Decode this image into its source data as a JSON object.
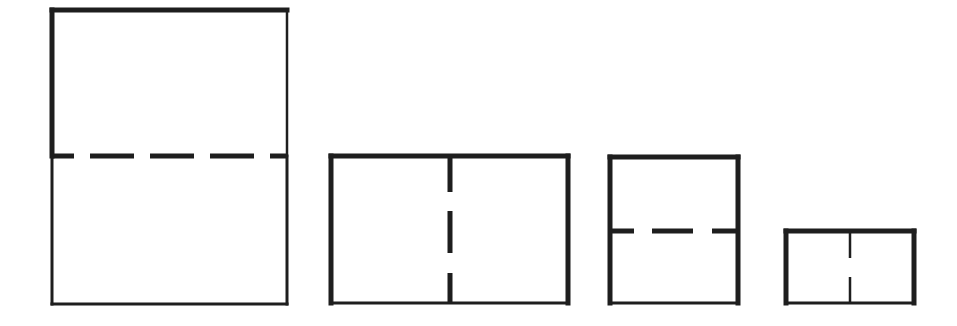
{
  "diagram": {
    "title": "Rectangle folding diagram",
    "stroke_color": "#1e1e1e",
    "background": "#ffffff",
    "shapes": [
      {
        "id": "shape-1",
        "label": "Tall rectangle folded horizontally",
        "x": 52,
        "y": 10,
        "w": 235,
        "h": 294,
        "edges": {
          "top": {
            "width": 5
          },
          "left_upper": {
            "width": 5
          },
          "right_upper": {
            "width": 2.5
          },
          "left_lower": {
            "width": 3
          },
          "right_lower": {
            "width": 3
          },
          "bottom": {
            "width": 3
          }
        },
        "fold": {
          "orientation": "horizontal",
          "pos": 156,
          "width": 5,
          "dash": "22 16 44 16 44 16 44 16 44 16 44",
          "offset": 0
        }
      },
      {
        "id": "shape-2",
        "label": "Wide rectangle folded vertically",
        "x": 331,
        "y": 156,
        "w": 237,
        "h": 147,
        "edges": {
          "top": {
            "width": 5
          },
          "left": {
            "width": 5
          },
          "right": {
            "width": 5
          },
          "bottom": {
            "width": 3
          }
        },
        "fold": {
          "orientation": "vertical",
          "pos": 450,
          "width": 5,
          "dash": "36 19 42 20 36",
          "offset": 0
        }
      },
      {
        "id": "shape-3",
        "label": "Square folded horizontally",
        "x": 610,
        "y": 157,
        "w": 128,
        "h": 146,
        "edges": {
          "top": {
            "width": 5
          },
          "left": {
            "width": 5
          },
          "right": {
            "width": 5
          },
          "bottom": {
            "width": 3
          }
        },
        "fold": {
          "orientation": "horizontal",
          "pos": 231,
          "width": 5,
          "dash": "24 18 41 19 30",
          "offset": 0
        }
      },
      {
        "id": "shape-4",
        "label": "Small rectangle folded vertically",
        "x": 786,
        "y": 231,
        "w": 128,
        "h": 72,
        "edges": {
          "top": {
            "width": 5
          },
          "left": {
            "width": 5
          },
          "right": {
            "width": 5
          },
          "bottom": {
            "width": 3
          }
        },
        "fold": {
          "orientation": "vertical",
          "pos": 850,
          "width": 2.5,
          "dash": "27 19 27",
          "offset": 0
        }
      }
    ]
  }
}
